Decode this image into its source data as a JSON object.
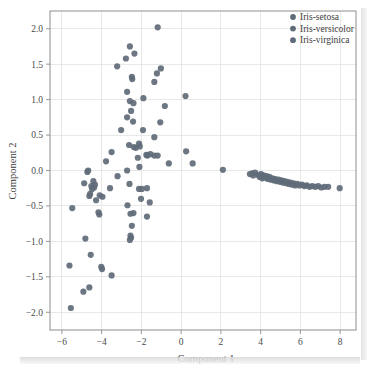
{
  "figure": {
    "background_color": "#ffffff",
    "marker_color": "#5f6b78",
    "marker_radius": 3.1,
    "marker_opacity": 0.92,
    "grid_color": "#e2e2e2",
    "axis_color": "#8d8d8d",
    "text_color": "#3c3c3c"
  },
  "legend": {
    "position": "top-right",
    "entries": [
      {
        "label": "Iris-setosa",
        "color": "#5f6b78"
      },
      {
        "label": "Iris-versicolor",
        "color": "#5f6b78"
      },
      {
        "label": "Iris-virginica",
        "color": "#5f6b78"
      }
    ]
  },
  "chart_data": {
    "type": "scatter",
    "title": "",
    "xlabel": "Component 1",
    "ylabel": "Component 2",
    "xlim": [
      -6.6,
      8.8
    ],
    "ylim": [
      -2.25,
      2.25
    ],
    "xticks": [
      -6,
      -4,
      -2,
      0,
      2,
      4,
      6,
      8
    ],
    "yticks": [
      -2.0,
      -1.5,
      -1.0,
      -0.5,
      0.0,
      0.5,
      1.0,
      1.5,
      2.0
    ],
    "xticklabels": [
      "−6",
      "−4",
      "−2",
      "0",
      "2",
      "4",
      "6",
      "8"
    ],
    "yticklabels": [
      "−2.0",
      "−1.5",
      "−1.0",
      "−0.5",
      "0.0",
      "0.5",
      "1.0",
      "1.5",
      "2.0"
    ],
    "grid": true,
    "legend_position": "upper right",
    "series": [
      {
        "name": "Iris-setosa",
        "color": "#5f6b78",
        "points": [
          [
            3.46,
            -0.05
          ],
          [
            3.58,
            -0.04
          ],
          [
            3.63,
            -0.07
          ],
          [
            3.72,
            -0.03
          ],
          [
            3.86,
            -0.06
          ],
          [
            3.95,
            -0.09
          ],
          [
            4.02,
            -0.05
          ],
          [
            4.08,
            -0.11
          ],
          [
            4.15,
            -0.07
          ],
          [
            4.22,
            -0.1
          ],
          [
            4.3,
            -0.08
          ],
          [
            4.36,
            -0.12
          ],
          [
            4.44,
            -0.09
          ],
          [
            4.52,
            -0.13
          ],
          [
            4.6,
            -0.11
          ],
          [
            4.68,
            -0.14
          ],
          [
            4.74,
            -0.12
          ],
          [
            4.82,
            -0.15
          ],
          [
            4.9,
            -0.13
          ],
          [
            4.98,
            -0.16
          ],
          [
            5.05,
            -0.14
          ],
          [
            5.12,
            -0.17
          ],
          [
            5.2,
            -0.15
          ],
          [
            5.28,
            -0.18
          ],
          [
            5.35,
            -0.16
          ],
          [
            5.42,
            -0.19
          ],
          [
            5.5,
            -0.17
          ],
          [
            5.58,
            -0.2
          ],
          [
            5.66,
            -0.18
          ],
          [
            5.74,
            -0.21
          ],
          [
            5.85,
            -0.19
          ],
          [
            5.96,
            -0.21
          ],
          [
            6.08,
            -0.2
          ],
          [
            6.2,
            -0.22
          ],
          [
            6.32,
            -0.21
          ],
          [
            6.46,
            -0.23
          ],
          [
            6.6,
            -0.22
          ],
          [
            6.75,
            -0.23
          ],
          [
            6.9,
            -0.22
          ],
          [
            7.05,
            -0.24
          ],
          [
            7.22,
            -0.23
          ],
          [
            7.4,
            -0.23
          ],
          [
            7.98,
            -0.25
          ],
          [
            2.1,
            0.01
          ]
        ]
      },
      {
        "name": "Iris-versicolor",
        "color": "#5f6b78",
        "points": [
          [
            -1.18,
            2.02
          ],
          [
            -2.58,
            1.75
          ],
          [
            -2.35,
            1.65
          ],
          [
            -2.78,
            1.58
          ],
          [
            -3.22,
            1.47
          ],
          [
            -1.02,
            1.44
          ],
          [
            -1.22,
            1.37
          ],
          [
            -2.48,
            1.32
          ],
          [
            -2.46,
            1.29
          ],
          [
            -1.35,
            1.25
          ],
          [
            -2.72,
            1.11
          ],
          [
            0.22,
            1.05
          ],
          [
            -1.9,
            1.02
          ],
          [
            -2.58,
            0.98
          ],
          [
            -2.4,
            0.95
          ],
          [
            -0.82,
            0.91
          ],
          [
            -2.52,
            0.84
          ],
          [
            -2.72,
            0.75
          ],
          [
            -2.42,
            0.69
          ],
          [
            -1.05,
            0.68
          ],
          [
            -3.02,
            0.57
          ],
          [
            -1.92,
            0.57
          ],
          [
            -1.35,
            0.47
          ],
          [
            -2.62,
            0.36
          ],
          [
            -2.38,
            0.33
          ],
          [
            -2.28,
            0.32
          ],
          [
            -2.12,
            0.38
          ],
          [
            -2.08,
            0.34
          ],
          [
            -3.5,
            0.26
          ],
          [
            0.25,
            0.27
          ],
          [
            -2.18,
            0.18
          ],
          [
            -1.75,
            0.22
          ],
          [
            -1.7,
            0.21
          ],
          [
            -1.55,
            0.23
          ],
          [
            -1.35,
            0.21
          ],
          [
            -1.18,
            0.21
          ],
          [
            -2.1,
            0.05
          ],
          [
            -3.78,
            0.13
          ],
          [
            -0.62,
            0.1
          ],
          [
            0.58,
            0.1
          ]
        ]
      },
      {
        "name": "Iris-virginica",
        "color": "#5f6b78",
        "points": [
          [
            -2.72,
            0.0
          ],
          [
            -4.68,
            0.0
          ],
          [
            -4.72,
            -0.02
          ],
          [
            -3.2,
            -0.08
          ],
          [
            -4.88,
            -0.18
          ],
          [
            -4.42,
            -0.15
          ],
          [
            -4.34,
            -0.2
          ],
          [
            -4.52,
            -0.22
          ],
          [
            -4.48,
            -0.26
          ],
          [
            -4.38,
            -0.24
          ],
          [
            -3.58,
            -0.25
          ],
          [
            -2.6,
            -0.19
          ],
          [
            -2.12,
            -0.26
          ],
          [
            -1.98,
            -0.26
          ],
          [
            -1.72,
            -0.25
          ],
          [
            -4.58,
            -0.33
          ],
          [
            -4.62,
            -0.36
          ],
          [
            -4.1,
            -0.35
          ],
          [
            -3.96,
            -0.37
          ],
          [
            -4.28,
            -0.42
          ],
          [
            -1.58,
            -0.45
          ],
          [
            -2.02,
            -0.4
          ],
          [
            -2.7,
            -0.49
          ],
          [
            -5.48,
            -0.53
          ],
          [
            -2.55,
            -0.61
          ],
          [
            -2.4,
            -0.6
          ],
          [
            -4.16,
            -0.59
          ],
          [
            -4.12,
            -0.62
          ],
          [
            -1.72,
            -0.65
          ],
          [
            -2.48,
            -0.78
          ],
          [
            -2.55,
            -0.92
          ],
          [
            -2.52,
            -0.95
          ],
          [
            -2.58,
            -0.98
          ],
          [
            -4.82,
            -0.96
          ],
          [
            -4.55,
            -1.19
          ],
          [
            -5.62,
            -1.34
          ],
          [
            -4.02,
            -1.36
          ],
          [
            -3.98,
            -1.39
          ],
          [
            -3.5,
            -1.48
          ],
          [
            -4.92,
            -1.71
          ],
          [
            -4.62,
            -1.65
          ],
          [
            -5.55,
            -1.94
          ]
        ]
      }
    ]
  }
}
